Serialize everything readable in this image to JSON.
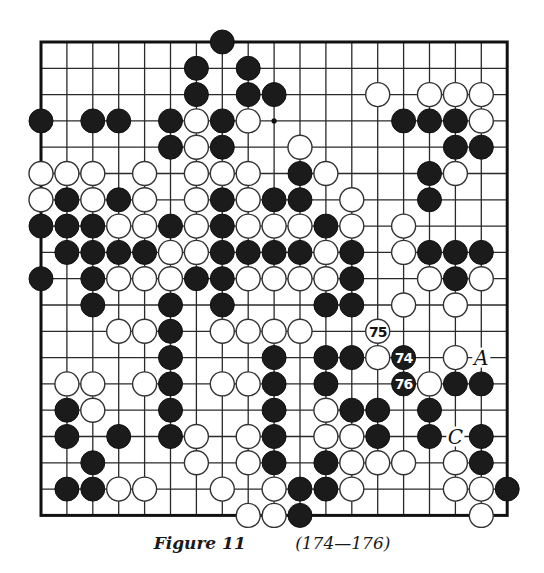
{
  "figure": {
    "caption_label": "Figure 11",
    "caption_moves": "(174—176)"
  },
  "board": {
    "size": 19,
    "origin_x": 41,
    "origin_y": 42,
    "spacing_x": 25.9,
    "spacing_y": 26.3,
    "stone_radius": 12,
    "colors": {
      "black": "#1b1b1b",
      "white": "#ffffff",
      "line": "#2a2a2a"
    },
    "star_points": [
      [
        9,
        3
      ]
    ],
    "stones": [
      {
        "r": 0,
        "c": 7,
        "color": "B"
      },
      {
        "r": 1,
        "c": 6,
        "color": "B"
      },
      {
        "r": 1,
        "c": 8,
        "color": "B"
      },
      {
        "r": 2,
        "c": 6,
        "color": "B"
      },
      {
        "r": 2,
        "c": 8,
        "color": "B"
      },
      {
        "r": 2,
        "c": 9,
        "color": "B"
      },
      {
        "r": 2,
        "c": 13,
        "color": "W"
      },
      {
        "r": 2,
        "c": 15,
        "color": "W"
      },
      {
        "r": 2,
        "c": 16,
        "color": "W"
      },
      {
        "r": 2,
        "c": 17,
        "color": "W"
      },
      {
        "r": 3,
        "c": 0,
        "color": "B"
      },
      {
        "r": 3,
        "c": 2,
        "color": "B"
      },
      {
        "r": 3,
        "c": 3,
        "color": "B"
      },
      {
        "r": 3,
        "c": 5,
        "color": "B"
      },
      {
        "r": 3,
        "c": 6,
        "color": "W"
      },
      {
        "r": 3,
        "c": 7,
        "color": "B"
      },
      {
        "r": 3,
        "c": 8,
        "color": "W"
      },
      {
        "r": 3,
        "c": 14,
        "color": "B"
      },
      {
        "r": 3,
        "c": 15,
        "color": "B"
      },
      {
        "r": 3,
        "c": 16,
        "color": "B"
      },
      {
        "r": 3,
        "c": 17,
        "color": "W"
      },
      {
        "r": 4,
        "c": 5,
        "color": "B"
      },
      {
        "r": 4,
        "c": 6,
        "color": "W"
      },
      {
        "r": 4,
        "c": 7,
        "color": "B"
      },
      {
        "r": 4,
        "c": 10,
        "color": "W"
      },
      {
        "r": 4,
        "c": 16,
        "color": "B"
      },
      {
        "r": 4,
        "c": 17,
        "color": "B"
      },
      {
        "r": 5,
        "c": 0,
        "color": "W"
      },
      {
        "r": 5,
        "c": 1,
        "color": "W"
      },
      {
        "r": 5,
        "c": 2,
        "color": "W"
      },
      {
        "r": 5,
        "c": 4,
        "color": "W"
      },
      {
        "r": 5,
        "c": 6,
        "color": "W"
      },
      {
        "r": 5,
        "c": 7,
        "color": "W"
      },
      {
        "r": 5,
        "c": 8,
        "color": "W"
      },
      {
        "r": 5,
        "c": 10,
        "color": "B"
      },
      {
        "r": 5,
        "c": 11,
        "color": "W"
      },
      {
        "r": 5,
        "c": 15,
        "color": "B"
      },
      {
        "r": 5,
        "c": 16,
        "color": "W"
      },
      {
        "r": 6,
        "c": 0,
        "color": "W"
      },
      {
        "r": 6,
        "c": 1,
        "color": "B"
      },
      {
        "r": 6,
        "c": 2,
        "color": "W"
      },
      {
        "r": 6,
        "c": 3,
        "color": "B"
      },
      {
        "r": 6,
        "c": 4,
        "color": "W"
      },
      {
        "r": 6,
        "c": 6,
        "color": "W"
      },
      {
        "r": 6,
        "c": 7,
        "color": "B"
      },
      {
        "r": 6,
        "c": 8,
        "color": "W"
      },
      {
        "r": 6,
        "c": 9,
        "color": "B"
      },
      {
        "r": 6,
        "c": 10,
        "color": "B"
      },
      {
        "r": 6,
        "c": 12,
        "color": "W"
      },
      {
        "r": 6,
        "c": 15,
        "color": "B"
      },
      {
        "r": 7,
        "c": 0,
        "color": "B"
      },
      {
        "r": 7,
        "c": 1,
        "color": "B"
      },
      {
        "r": 7,
        "c": 2,
        "color": "B"
      },
      {
        "r": 7,
        "c": 3,
        "color": "W"
      },
      {
        "r": 7,
        "c": 4,
        "color": "W"
      },
      {
        "r": 7,
        "c": 5,
        "color": "B"
      },
      {
        "r": 7,
        "c": 6,
        "color": "W"
      },
      {
        "r": 7,
        "c": 7,
        "color": "B"
      },
      {
        "r": 7,
        "c": 8,
        "color": "W"
      },
      {
        "r": 7,
        "c": 9,
        "color": "W"
      },
      {
        "r": 7,
        "c": 10,
        "color": "W"
      },
      {
        "r": 7,
        "c": 11,
        "color": "B"
      },
      {
        "r": 7,
        "c": 12,
        "color": "W"
      },
      {
        "r": 7,
        "c": 14,
        "color": "W"
      },
      {
        "r": 8,
        "c": 1,
        "color": "B"
      },
      {
        "r": 8,
        "c": 2,
        "color": "B"
      },
      {
        "r": 8,
        "c": 3,
        "color": "B"
      },
      {
        "r": 8,
        "c": 4,
        "color": "B"
      },
      {
        "r": 8,
        "c": 5,
        "color": "W"
      },
      {
        "r": 8,
        "c": 6,
        "color": "W"
      },
      {
        "r": 8,
        "c": 7,
        "color": "B"
      },
      {
        "r": 8,
        "c": 8,
        "color": "B"
      },
      {
        "r": 8,
        "c": 9,
        "color": "B"
      },
      {
        "r": 8,
        "c": 10,
        "color": "B"
      },
      {
        "r": 8,
        "c": 11,
        "color": "W"
      },
      {
        "r": 8,
        "c": 12,
        "color": "B"
      },
      {
        "r": 8,
        "c": 14,
        "color": "W"
      },
      {
        "r": 8,
        "c": 15,
        "color": "B"
      },
      {
        "r": 8,
        "c": 16,
        "color": "B"
      },
      {
        "r": 8,
        "c": 17,
        "color": "B"
      },
      {
        "r": 9,
        "c": 0,
        "color": "B"
      },
      {
        "r": 9,
        "c": 2,
        "color": "B"
      },
      {
        "r": 9,
        "c": 3,
        "color": "W"
      },
      {
        "r": 9,
        "c": 4,
        "color": "W"
      },
      {
        "r": 9,
        "c": 5,
        "color": "W"
      },
      {
        "r": 9,
        "c": 6,
        "color": "B"
      },
      {
        "r": 9,
        "c": 7,
        "color": "B"
      },
      {
        "r": 9,
        "c": 8,
        "color": "W"
      },
      {
        "r": 9,
        "c": 9,
        "color": "W"
      },
      {
        "r": 9,
        "c": 10,
        "color": "W"
      },
      {
        "r": 9,
        "c": 11,
        "color": "W"
      },
      {
        "r": 9,
        "c": 12,
        "color": "B"
      },
      {
        "r": 9,
        "c": 15,
        "color": "W"
      },
      {
        "r": 9,
        "c": 16,
        "color": "B"
      },
      {
        "r": 9,
        "c": 17,
        "color": "W"
      },
      {
        "r": 10,
        "c": 2,
        "color": "B"
      },
      {
        "r": 10,
        "c": 5,
        "color": "B"
      },
      {
        "r": 10,
        "c": 7,
        "color": "B"
      },
      {
        "r": 10,
        "c": 11,
        "color": "B"
      },
      {
        "r": 10,
        "c": 12,
        "color": "B"
      },
      {
        "r": 10,
        "c": 14,
        "color": "W"
      },
      {
        "r": 10,
        "c": 16,
        "color": "W"
      },
      {
        "r": 11,
        "c": 3,
        "color": "W"
      },
      {
        "r": 11,
        "c": 4,
        "color": "W"
      },
      {
        "r": 11,
        "c": 5,
        "color": "B"
      },
      {
        "r": 11,
        "c": 7,
        "color": "W"
      },
      {
        "r": 11,
        "c": 8,
        "color": "W"
      },
      {
        "r": 11,
        "c": 9,
        "color": "W"
      },
      {
        "r": 11,
        "c": 10,
        "color": "W"
      },
      {
        "r": 11,
        "c": 13,
        "color": "W",
        "label": "75"
      },
      {
        "r": 12,
        "c": 5,
        "color": "B"
      },
      {
        "r": 12,
        "c": 9,
        "color": "B"
      },
      {
        "r": 12,
        "c": 11,
        "color": "B"
      },
      {
        "r": 12,
        "c": 12,
        "color": "B"
      },
      {
        "r": 12,
        "c": 13,
        "color": "W"
      },
      {
        "r": 12,
        "c": 14,
        "color": "B",
        "label": "74"
      },
      {
        "r": 12,
        "c": 16,
        "color": "W"
      },
      {
        "r": 13,
        "c": 1,
        "color": "W"
      },
      {
        "r": 13,
        "c": 2,
        "color": "W"
      },
      {
        "r": 13,
        "c": 4,
        "color": "W"
      },
      {
        "r": 13,
        "c": 5,
        "color": "B"
      },
      {
        "r": 13,
        "c": 7,
        "color": "W"
      },
      {
        "r": 13,
        "c": 8,
        "color": "W"
      },
      {
        "r": 13,
        "c": 9,
        "color": "B"
      },
      {
        "r": 13,
        "c": 11,
        "color": "B"
      },
      {
        "r": 13,
        "c": 14,
        "color": "B",
        "label": "76"
      },
      {
        "r": 13,
        "c": 15,
        "color": "W"
      },
      {
        "r": 13,
        "c": 16,
        "color": "B"
      },
      {
        "r": 13,
        "c": 17,
        "color": "B"
      },
      {
        "r": 14,
        "c": 1,
        "color": "B"
      },
      {
        "r": 14,
        "c": 2,
        "color": "W"
      },
      {
        "r": 14,
        "c": 5,
        "color": "B"
      },
      {
        "r": 14,
        "c": 9,
        "color": "B"
      },
      {
        "r": 14,
        "c": 11,
        "color": "W"
      },
      {
        "r": 14,
        "c": 12,
        "color": "B"
      },
      {
        "r": 14,
        "c": 13,
        "color": "B"
      },
      {
        "r": 14,
        "c": 15,
        "color": "B"
      },
      {
        "r": 15,
        "c": 1,
        "color": "B"
      },
      {
        "r": 15,
        "c": 3,
        "color": "B"
      },
      {
        "r": 15,
        "c": 5,
        "color": "B"
      },
      {
        "r": 15,
        "c": 6,
        "color": "W"
      },
      {
        "r": 15,
        "c": 8,
        "color": "W"
      },
      {
        "r": 15,
        "c": 9,
        "color": "B"
      },
      {
        "r": 15,
        "c": 11,
        "color": "W"
      },
      {
        "r": 15,
        "c": 12,
        "color": "W"
      },
      {
        "r": 15,
        "c": 13,
        "color": "B"
      },
      {
        "r": 15,
        "c": 15,
        "color": "B"
      },
      {
        "r": 15,
        "c": 17,
        "color": "B"
      },
      {
        "r": 16,
        "c": 2,
        "color": "B"
      },
      {
        "r": 16,
        "c": 6,
        "color": "W"
      },
      {
        "r": 16,
        "c": 8,
        "color": "W"
      },
      {
        "r": 16,
        "c": 9,
        "color": "B"
      },
      {
        "r": 16,
        "c": 11,
        "color": "B"
      },
      {
        "r": 16,
        "c": 12,
        "color": "W"
      },
      {
        "r": 16,
        "c": 13,
        "color": "W"
      },
      {
        "r": 16,
        "c": 14,
        "color": "W"
      },
      {
        "r": 16,
        "c": 16,
        "color": "W"
      },
      {
        "r": 16,
        "c": 17,
        "color": "B"
      },
      {
        "r": 17,
        "c": 1,
        "color": "B"
      },
      {
        "r": 17,
        "c": 2,
        "color": "B"
      },
      {
        "r": 17,
        "c": 3,
        "color": "W"
      },
      {
        "r": 17,
        "c": 4,
        "color": "W"
      },
      {
        "r": 17,
        "c": 7,
        "color": "W"
      },
      {
        "r": 17,
        "c": 9,
        "color": "W"
      },
      {
        "r": 17,
        "c": 10,
        "color": "B"
      },
      {
        "r": 17,
        "c": 11,
        "color": "B"
      },
      {
        "r": 17,
        "c": 12,
        "color": "W"
      },
      {
        "r": 17,
        "c": 16,
        "color": "W"
      },
      {
        "r": 17,
        "c": 17,
        "color": "W"
      },
      {
        "r": 17,
        "c": 18,
        "color": "B"
      },
      {
        "r": 18,
        "c": 8,
        "color": "W"
      },
      {
        "r": 18,
        "c": 9,
        "color": "W"
      },
      {
        "r": 18,
        "c": 10,
        "color": "B"
      },
      {
        "r": 18,
        "c": 17,
        "color": "W"
      }
    ],
    "point_labels": [
      {
        "r": 12,
        "c": 17,
        "text": "A"
      },
      {
        "r": 15,
        "c": 16,
        "text": "C"
      }
    ]
  }
}
